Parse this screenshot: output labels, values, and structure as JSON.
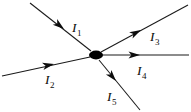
{
  "figure": {
    "background_color": "#ffffff",
    "line_color": "#1a1a1a",
    "node_color": "#000000",
    "label_color": "#0d0d0d",
    "width": 191,
    "height": 112
  },
  "node": {
    "name": "junction",
    "cx": 96,
    "cy": 55,
    "rx": 7.0,
    "ry": 4.4
  },
  "branches": [
    {
      "id": "I1",
      "label_main": "I",
      "label_sub": "1",
      "direction": "into-node",
      "description": "branch from upper-left, current flowing toward the node",
      "line": {
        "x1": 30,
        "y1": 3,
        "x2": 91,
        "y2": 51
      },
      "arrow": {
        "x": 64,
        "y": 29,
        "angle_deg": 38
      },
      "label_pos": {
        "x": 72,
        "y": 32
      }
    },
    {
      "id": "I2",
      "label_main": "I",
      "label_sub": "2",
      "direction": "into-node",
      "description": "branch from lower-left, current flowing toward the node",
      "line": {
        "x1": 2,
        "y1": 76,
        "x2": 90,
        "y2": 57
      },
      "arrow": {
        "x": 54,
        "y": 64,
        "angle_deg": -12
      },
      "label_pos": {
        "x": 45,
        "y": 84
      }
    },
    {
      "id": "I3",
      "label_main": "I",
      "label_sub": "3",
      "direction": "out-of-node",
      "description": "branch to upper-right, current flowing away from the node",
      "line": {
        "x1": 101,
        "y1": 52,
        "x2": 188,
        "y2": 5
      },
      "arrow": {
        "x": 141,
        "y": 30,
        "angle_deg": -28
      },
      "label_pos": {
        "x": 150,
        "y": 41
      }
    },
    {
      "id": "I4",
      "label_main": "I",
      "label_sub": "4",
      "direction": "out-of-node",
      "description": "horizontal branch to the right, current flowing away from the node",
      "line": {
        "x1": 102,
        "y1": 55,
        "x2": 189,
        "y2": 55
      },
      "arrow": {
        "x": 140,
        "y": 55,
        "angle_deg": 0
      },
      "label_pos": {
        "x": 137,
        "y": 75
      }
    },
    {
      "id": "I5",
      "label_main": "I",
      "label_sub": "5",
      "direction": "out-of-node",
      "description": "branch to lower-right, current flowing away from the node",
      "line": {
        "x1": 99,
        "y1": 60,
        "x2": 140,
        "y2": 110
      },
      "arrow": {
        "x": 116,
        "y": 81,
        "angle_deg": 50
      },
      "label_pos": {
        "x": 107,
        "y": 101
      }
    }
  ]
}
